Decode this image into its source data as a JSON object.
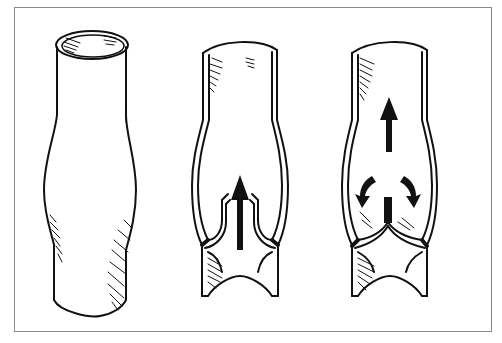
{
  "figure": {
    "panels": [
      {
        "id": "external-vein",
        "description": "Exterior view of a vein segment with a bulge at the valve site"
      },
      {
        "id": "open-valve",
        "description": "Cutaway view: valve cusps open, blood flowing upward"
      },
      {
        "id": "closed-valve",
        "description": "Cutaway view: valve cusps closed, backflow diverted into cusp pockets"
      }
    ],
    "colors": {
      "ink": "#111111",
      "frame": "#8a8a8a",
      "background": "#ffffff"
    }
  }
}
